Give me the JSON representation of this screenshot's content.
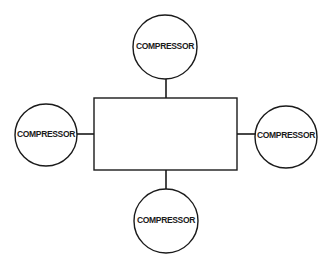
{
  "diagram": {
    "type": "hub-and-spoke",
    "central_block": {
      "label": "",
      "x": 94,
      "y": 98,
      "width": 143,
      "height": 72
    },
    "nodes": [
      {
        "id": "top",
        "label": "COMPRESSOR",
        "cx": 165,
        "cy": 47,
        "r": 32
      },
      {
        "id": "left",
        "label": "COMPRESSOR",
        "cx": 46,
        "cy": 135,
        "r": 31
      },
      {
        "id": "right",
        "label": "COMPRESSOR",
        "cx": 286,
        "cy": 137,
        "r": 31
      },
      {
        "id": "bottom",
        "label": "COMPRESSOR",
        "cx": 166,
        "cy": 221,
        "r": 32
      }
    ],
    "connections": [
      {
        "from": "top",
        "to": "central_block"
      },
      {
        "from": "left",
        "to": "central_block"
      },
      {
        "from": "right",
        "to": "central_block"
      },
      {
        "from": "bottom",
        "to": "central_block"
      }
    ],
    "colors": {
      "line": "#1a1a1a",
      "background": "#ffffff"
    }
  }
}
